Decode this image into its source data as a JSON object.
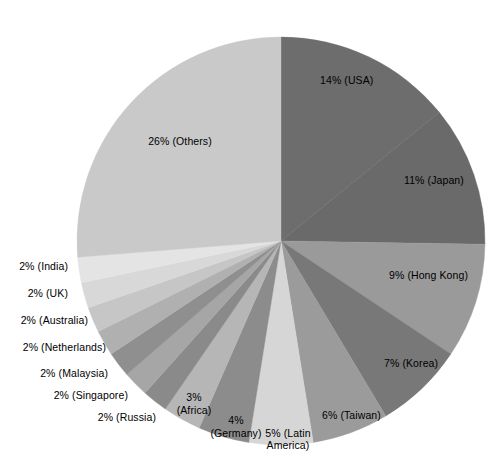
{
  "chart_data": {
    "type": "pie",
    "title": "",
    "subtitle": "",
    "xlabel": "",
    "ylabel": "",
    "legend_position": "none",
    "grid": false,
    "units": "percent",
    "start_angle_deg": 0,
    "direction": "clockwise",
    "total": 100,
    "categories": [
      "USA",
      "Japan",
      "Hong Kong",
      "Korea",
      "Taiwan",
      "Latin America",
      "Germany",
      "Africa",
      "Russia",
      "Singapore",
      "Malaysia",
      "Netherlands",
      "Australia",
      "UK",
      "India",
      "Others"
    ],
    "values": [
      14,
      11,
      9,
      7,
      6,
      5,
      4,
      3,
      2,
      2,
      2,
      2,
      2,
      2,
      2,
      26
    ],
    "slices": [
      {
        "name": "USA",
        "value": 14,
        "label": "14% (USA)",
        "color": "#6d6d6d"
      },
      {
        "name": "Japan",
        "value": 11,
        "label": "11% (Japan)",
        "color": "#6a6a6a"
      },
      {
        "name": "Hong Kong",
        "value": 9,
        "label": "9% (Hong Kong)",
        "color": "#9a9a9a"
      },
      {
        "name": "Korea",
        "value": 7,
        "label": "7% (Korea)",
        "color": "#787878"
      },
      {
        "name": "Taiwan",
        "value": 6,
        "label": "6% (Taiwan)",
        "color": "#9b9b9b"
      },
      {
        "name": "Latin America",
        "value": 5,
        "label": "5% (Latin\nAmerica)",
        "color": "#d6d6d6"
      },
      {
        "name": "Germany",
        "value": 4,
        "label": "4%\n(Germany)",
        "color": "#8c8c8c"
      },
      {
        "name": "Africa",
        "value": 3,
        "label": "3%\n(Africa)",
        "color": "#b6b6b6"
      },
      {
        "name": "Russia",
        "value": 2,
        "label": "2% (Russia)",
        "color": "#8a8a8a"
      },
      {
        "name": "Singapore",
        "value": 2,
        "label": "2% (Singapore)",
        "color": "#a6a6a6"
      },
      {
        "name": "Malaysia",
        "value": 2,
        "label": "2% (Malaysia)",
        "color": "#8f8f8f"
      },
      {
        "name": "Netherlands",
        "value": 2,
        "label": "2% (Netherlands)",
        "color": "#b0b0b0"
      },
      {
        "name": "Australia",
        "value": 2,
        "label": "2% (Australia)",
        "color": "#c6c6c6"
      },
      {
        "name": "UK",
        "value": 2,
        "label": "2% (UK)",
        "color": "#d8d8d8"
      },
      {
        "name": "India",
        "value": 2,
        "label": "2% (India)",
        "color": "#e4e4e4"
      },
      {
        "name": "Others",
        "value": 26,
        "label": "26% (Others)",
        "color": "#c9c9c9"
      }
    ],
    "labels": {
      "usa": "14% (USA)",
      "japan": "11% (Japan)",
      "hong_kong": "9% (Hong Kong)",
      "korea": "7% (Korea)",
      "taiwan": "6% (Taiwan)",
      "latin_america_line1": "5% (Latin",
      "latin_america_line2": "America)",
      "germany_line1": "4%",
      "germany_line2": "(Germany)",
      "africa_line1": "3%",
      "africa_line2": "(Africa)",
      "russia": "2% (Russia)",
      "singapore": "2% (Singapore)",
      "malaysia": "2% (Malaysia)",
      "netherlands": "2% (Netherlands)",
      "australia": "2% (Australia)",
      "uk": "2% (UK)",
      "india": "2% (India)",
      "others": "26% (Others)"
    },
    "geometry": {
      "center_x": 281,
      "center_y": 241,
      "radius": 204
    },
    "background_color": "#ffffff",
    "text_color": "#000000"
  }
}
